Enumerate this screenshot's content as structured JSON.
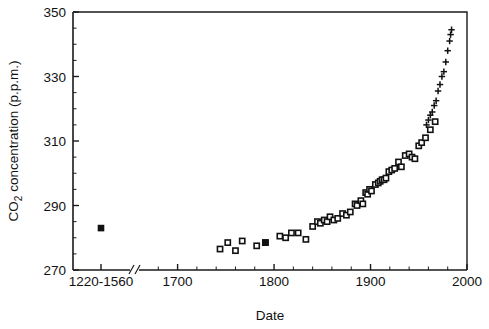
{
  "chart_data": {
    "type": "scatter",
    "title": "",
    "subtitle": "",
    "xlabel": "Date",
    "ylabel": "CO2 concentration (p.p.m.)",
    "ylabel_parts": {
      "pre": "CO",
      "sub": "2",
      "post": " concentration (p.p.m.)"
    },
    "xlim": [
      1660,
      2000
    ],
    "ylim": [
      270,
      350
    ],
    "grid": false,
    "legend": "none",
    "axis_break": {
      "present": true,
      "after_label": "1220-1560",
      "position_year": 1673
    },
    "yticks_major": [
      270,
      290,
      310,
      330,
      350
    ],
    "yticks_minor_step": 5,
    "xticks_major": [
      1700,
      1800,
      1900,
      2000
    ],
    "xticks_minor_step": 20,
    "xtick_labels": [
      "1220-1560",
      "1700",
      "1800",
      "1900",
      "2000"
    ],
    "series": [
      {
        "name": "ice-core (pre-1560 mean)",
        "marker": "filled-square",
        "points": [
          [
            1390,
            283.0
          ]
        ]
      },
      {
        "name": "ice-core CO2",
        "marker": "open-square",
        "points": [
          [
            1744,
            276.5
          ],
          [
            1752,
            278.5
          ],
          [
            1760,
            276.0
          ],
          [
            1767,
            279.0
          ],
          [
            1782,
            277.5
          ],
          [
            1791,
            278.5
          ],
          [
            1806,
            280.5
          ],
          [
            1812,
            280.0
          ],
          [
            1818,
            281.5
          ],
          [
            1825,
            281.5
          ],
          [
            1833,
            279.5
          ],
          [
            1840,
            283.5
          ],
          [
            1845,
            285.0
          ],
          [
            1848,
            284.5
          ],
          [
            1852,
            285.5
          ],
          [
            1855,
            285.0
          ],
          [
            1858,
            286.5
          ],
          [
            1862,
            285.5
          ],
          [
            1866,
            286.0
          ],
          [
            1871,
            287.5
          ],
          [
            1875,
            287.0
          ],
          [
            1879,
            288.0
          ],
          [
            1884,
            290.5
          ],
          [
            1886,
            290.0
          ],
          [
            1890,
            291.5
          ],
          [
            1892,
            290.5
          ],
          [
            1895,
            294.0
          ],
          [
            1897,
            293.5
          ],
          [
            1899,
            295.0
          ],
          [
            1901,
            294.5
          ],
          [
            1905,
            296.5
          ],
          [
            1908,
            297.0
          ],
          [
            1910,
            297.5
          ],
          [
            1912,
            298.0
          ],
          [
            1914,
            298.0
          ],
          [
            1916,
            298.5
          ],
          [
            1919,
            300.5
          ],
          [
            1922,
            301.0
          ],
          [
            1925,
            301.5
          ],
          [
            1929,
            303.5
          ],
          [
            1932,
            302.0
          ],
          [
            1936,
            305.5
          ],
          [
            1940,
            306.0
          ],
          [
            1943,
            305.0
          ],
          [
            1946,
            304.5
          ],
          [
            1950,
            308.5
          ],
          [
            1953,
            309.5
          ],
          [
            1957,
            311.0
          ],
          [
            1962,
            313.5
          ],
          [
            1967,
            316.0
          ]
        ]
      },
      {
        "name": "Mauna Loa atmospheric CO2",
        "marker": "cross",
        "points": [
          [
            1958,
            315.0
          ],
          [
            1960,
            316.5
          ],
          [
            1962,
            318.0
          ],
          [
            1964,
            319.0
          ],
          [
            1966,
            321.0
          ],
          [
            1968,
            322.5
          ],
          [
            1970,
            325.5
          ],
          [
            1972,
            327.5
          ],
          [
            1974,
            330.0
          ],
          [
            1976,
            331.5
          ],
          [
            1978,
            334.5
          ],
          [
            1980,
            338.0
          ],
          [
            1982,
            341.0
          ],
          [
            1983,
            343.0
          ],
          [
            1984,
            344.5
          ]
        ]
      }
    ]
  },
  "axes": {
    "y_title": "CO2 concentration (p.p.m.)",
    "x_title": "Date"
  }
}
